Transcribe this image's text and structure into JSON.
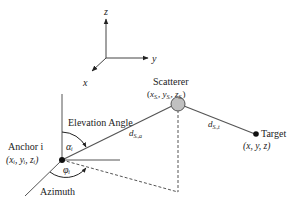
{
  "axes": {
    "z_label": "z",
    "y_label": "y",
    "x_label": "x"
  },
  "scatterer": {
    "title": "Scatterer",
    "coord_x": "x",
    "coord_y": "y",
    "coord_z": "z",
    "sub": "Sᵢ"
  },
  "anchor": {
    "title": "Anchor i",
    "coords": "(xᵢ, yᵢ, zᵢ)"
  },
  "target": {
    "title": "Target",
    "coords": "(x, y, z)"
  },
  "angles": {
    "elevation_label": "Elevation Angle",
    "elevation_symbol": "αᵢ",
    "azimuth_label": "Azimuth",
    "azimuth_symbol": "φᵢ"
  },
  "distances": {
    "anchor_scatterer": "d",
    "anchor_scatterer_sub": "Sᵢ,a",
    "scatterer_target": "d",
    "scatterer_target_sub": "Sᵢ,t"
  },
  "colors": {
    "line": "#333333",
    "scatterer_fill": "#c0c0c0"
  }
}
